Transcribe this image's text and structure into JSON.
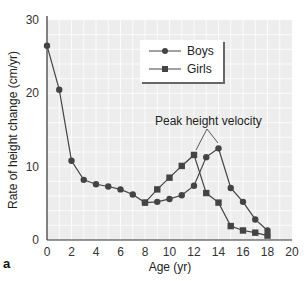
{
  "chart_data": {
    "type": "line",
    "title": "",
    "xlabel": "Age (yr)",
    "ylabel": "Rate of height change (cm/yr)",
    "xlim": [
      0,
      20
    ],
    "ylim": [
      0,
      30
    ],
    "x_ticks": [
      "0",
      "2",
      "4",
      "6",
      "8",
      "10",
      "12",
      "14",
      "16",
      "18",
      "20"
    ],
    "y_ticks": [
      "0",
      "10",
      "20",
      "30"
    ],
    "grid": true,
    "legend_position": "upper right",
    "series": [
      {
        "name": "Boys",
        "marker": "circle",
        "x": [
          0,
          1,
          2,
          3,
          4,
          5,
          6,
          7,
          8,
          9,
          10,
          11,
          12,
          13,
          14,
          15,
          16,
          17,
          18
        ],
        "values": [
          26.5,
          20.5,
          10.8,
          8.2,
          7.6,
          7.3,
          6.9,
          6.2,
          5.1,
          5.2,
          5.6,
          6.1,
          7.4,
          11.3,
          12.5,
          7.1,
          5.2,
          2.8,
          1.3
        ]
      },
      {
        "name": "Girls",
        "marker": "square",
        "x": [
          8,
          9,
          10,
          11,
          12,
          13,
          14,
          15,
          16,
          17,
          18
        ],
        "values": [
          5.1,
          6.9,
          8.5,
          10.1,
          11.6,
          6.4,
          5.1,
          1.9,
          1.3,
          1.0,
          0.6
        ]
      }
    ],
    "annotations": [
      {
        "text": "Peak height velocity",
        "points_to": [
          {
            "series": "Girls",
            "x": 12
          },
          {
            "series": "Boys",
            "x": 14
          }
        ]
      }
    ],
    "panel_label": "a"
  },
  "colors": {
    "plot_bg": "#ededee",
    "grid": "#ffffff",
    "series": "#444444",
    "axis": "#333333"
  }
}
